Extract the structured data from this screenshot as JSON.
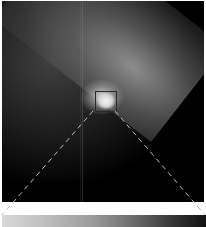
{
  "figure": {
    "zoom_box": {
      "x": 93,
      "y": 90,
      "width": 22,
      "height": 21,
      "color": "#2a2a2a"
    },
    "connector_lines": {
      "style": "dashed",
      "color": "#bbbbbb"
    },
    "colorbar": {
      "direction": "light-to-dark",
      "from": "#d8d8d8",
      "to": "#111111"
    }
  }
}
